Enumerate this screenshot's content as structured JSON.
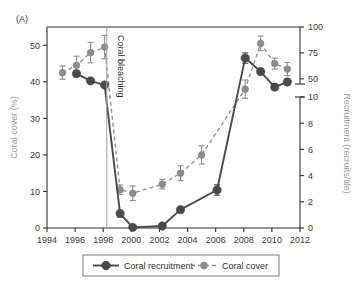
{
  "panel": {
    "label": "(A)"
  },
  "annotation": {
    "bleaching": "Coral bleaching",
    "bleaching_year": 1998.25
  },
  "axes": {
    "x": {
      "label": "",
      "min": 1994,
      "max": 2012,
      "ticks": [
        1994,
        1996,
        1998,
        2000,
        2002,
        2004,
        2006,
        2008,
        2010,
        2012
      ],
      "tick_labels": [
        "1994",
        "1996",
        "1998",
        "2000",
        "2002",
        "2004",
        "2006",
        "2008",
        "2010",
        "2012"
      ]
    },
    "y_left": {
      "label": "Coral cover (%)",
      "color": "#9a9a9a",
      "min": 0,
      "max": 55,
      "ticks": [
        0,
        10,
        20,
        30,
        40,
        50
      ],
      "tick_labels": [
        "0",
        "10",
        "20",
        "30",
        "40",
        "50"
      ]
    },
    "y_right": {
      "label": "Recruitment (recruits/tile)",
      "color": "#9a9a9a",
      "broken": true,
      "lower_ticks": [
        0,
        2,
        4,
        6,
        8,
        10
      ],
      "lower_tick_labels": [
        "0",
        "2",
        "4",
        "6",
        "8",
        "10"
      ],
      "upper_ticks": [
        50,
        75,
        100
      ],
      "upper_tick_labels": [
        "50",
        "75",
        "100"
      ]
    }
  },
  "colors": {
    "recruitment": "#4a4a4a",
    "cover": "#8c8c8c",
    "axis": "#2e2e2e",
    "bleaching_line": "#a8a8a8"
  },
  "legend": {
    "items": [
      {
        "label": "Coral recruitment",
        "key": "recruitment",
        "style": "solid"
      },
      {
        "label": "Coral cover",
        "key": "cover",
        "style": "dashed"
      }
    ]
  },
  "chart_data": {
    "type": "line",
    "title": "",
    "xlabel": "",
    "ylabel": "Coral cover (%)",
    "y2label": "Recruitment (recruits/tile)",
    "xlim": [
      1994,
      2012
    ],
    "ylim": [
      0,
      55
    ],
    "y2lim_lower": [
      0,
      10
    ],
    "y2lim_upper": [
      45,
      100
    ],
    "grid": false,
    "legend_position": "bottom",
    "annotations": [
      {
        "text": "Coral bleaching",
        "x": 1998.25,
        "orientation": "vertical",
        "vline": true
      }
    ],
    "series": [
      {
        "name": "Coral cover",
        "axis": "left",
        "units": "%",
        "style": "dashed",
        "color": "#8c8c8c",
        "x": [
          1995.1,
          1996.1,
          1997.1,
          1998.1,
          1999.2,
          2000.1,
          2002.2,
          2003.5,
          2005.0,
          2008.1,
          2009.2,
          2010.2,
          2011.1
        ],
        "y": [
          42.5,
          44.5,
          48.0,
          49.5,
          10.5,
          9.5,
          12.0,
          15.0,
          20.0,
          38.0,
          50.5,
          45.0,
          43.5
        ],
        "yerr": [
          1.8,
          2.5,
          2.8,
          3.2,
          1.3,
          2.0,
          1.3,
          2.0,
          2.5,
          2.5,
          2.0,
          1.5,
          1.8
        ]
      },
      {
        "name": "Coral recruitment",
        "axis": "right",
        "units": "recruits/tile",
        "style": "solid",
        "color": "#4a4a4a",
        "x": [
          1996.1,
          1997.1,
          1998.1,
          1999.2,
          2000.1,
          2002.2,
          2003.5,
          2006.1,
          2008.1,
          2009.2,
          2010.2,
          2011.1
        ],
        "y": [
          55.0,
          48.0,
          44.0,
          1.1,
          0.05,
          0.15,
          1.4,
          2.9,
          70.0,
          57.0,
          42.0,
          47.0
        ],
        "yerr": [
          3.0,
          2.5,
          2.0,
          0.25,
          0.05,
          0.12,
          0.2,
          0.4,
          5.0,
          3.0,
          3.0,
          3.0
        ]
      }
    ]
  }
}
